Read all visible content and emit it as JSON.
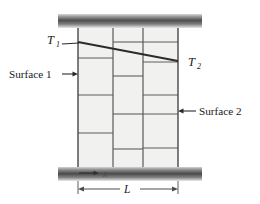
{
  "figure": {
    "name": "plane-wall-conduction-diagram",
    "labels": {
      "temperature_hot": "T",
      "temperature_hot_sub": "1",
      "temperature_cold": "T",
      "temperature_cold_sub": "2",
      "surface_left": "Surface 1",
      "surface_right": "Surface 2",
      "coordinate_x": "x",
      "thickness_L": "L"
    },
    "colors": {
      "block_fill": "#f1f1f0",
      "block_stroke": "#5a5a5a",
      "wall_outline": "#3a3a3a",
      "slab_dark": "#4a4a4a",
      "slab_light": "#e6e6e6",
      "temperature_line": "#2b2b2b",
      "dimension_line": "#4d4d4d",
      "leader_line": "#2b2b2b",
      "text": "#1a1a1a",
      "background": "#ffffff"
    },
    "geometry": {
      "wall_left_x": 78,
      "wall_right_x": 178,
      "wall_top_y": 28,
      "wall_bottom_y": 167,
      "column_dividers_x": [
        113,
        143
      ],
      "slab_top": {
        "x": 58,
        "y": 14,
        "width": 144,
        "height": 14
      },
      "slab_bottom": {
        "x": 58,
        "y": 167,
        "width": 144,
        "height": 14
      },
      "temperature_line_start": {
        "x": 78,
        "y": 42
      },
      "temperature_line_end": {
        "x": 178,
        "y": 61
      },
      "dimension_L_y": 189,
      "coordinate_x_y": 173
    },
    "courses": {
      "left_column": [
        58,
        95,
        133
      ],
      "middle_column": [
        42,
        76,
        114,
        149
      ],
      "right_column": [
        42,
        62,
        95,
        114,
        148
      ]
    }
  }
}
